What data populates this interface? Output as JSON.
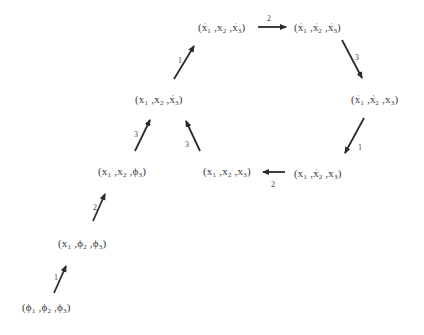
{
  "diagram": {
    "type": "state-transition",
    "colors": {
      "text": "#3a3a3a",
      "arrow": "#2b2b2b",
      "background": "#ffffff"
    },
    "nodes": [
      {
        "id": "n0",
        "label": "(φ1, φ2, φ3)",
        "parts": [
          [
            "φ",
            "1",
            ""
          ],
          [
            "φ",
            "2",
            ""
          ],
          [
            "φ",
            "3",
            ""
          ]
        ],
        "x": 22,
        "y": 300
      },
      {
        "id": "n1",
        "label": "(x1, φ2, φ3)",
        "parts": [
          [
            "x",
            "1",
            ""
          ],
          [
            "φ",
            "2",
            ""
          ],
          [
            "φ",
            "3",
            ""
          ]
        ],
        "x": 58,
        "y": 236
      },
      {
        "id": "n2",
        "label": "(x1, x2, φ3)",
        "parts": [
          [
            "x",
            "1",
            ""
          ],
          [
            "x",
            "2",
            ""
          ],
          [
            "φ",
            "3",
            ""
          ]
        ],
        "x": 98,
        "y": 164
      },
      {
        "id": "n3",
        "label": "(x1, x2, x'3)",
        "parts": [
          [
            "x",
            "1",
            ""
          ],
          [
            "x",
            "2",
            ""
          ],
          [
            "x",
            "3",
            "'"
          ]
        ],
        "x": 135,
        "y": 90
      },
      {
        "id": "n4",
        "label": "(x'1, x2, x'3)",
        "parts": [
          [
            "x",
            "1",
            "'"
          ],
          [
            "x",
            "2",
            ""
          ],
          [
            "x",
            "3",
            "'"
          ]
        ],
        "x": 198,
        "y": 18
      },
      {
        "id": "n5",
        "label": "(x'1, x'2, x'3)",
        "parts": [
          [
            "x",
            "1",
            "'"
          ],
          [
            "x",
            "2",
            "'"
          ],
          [
            "x",
            "3",
            "'"
          ]
        ],
        "x": 294,
        "y": 18
      },
      {
        "id": "n6",
        "label": "(x'1, x'2, x3)",
        "parts": [
          [
            "x",
            "1",
            "'"
          ],
          [
            "x",
            "2",
            "'"
          ],
          [
            "x",
            "3",
            ""
          ]
        ],
        "x": 351,
        "y": 90
      },
      {
        "id": "n7",
        "label": "(x1, x'2, x3)",
        "parts": [
          [
            "x",
            "1",
            ""
          ],
          [
            "x",
            "2",
            "'"
          ],
          [
            "x",
            "3",
            ""
          ]
        ],
        "x": 294,
        "y": 164
      },
      {
        "id": "n8",
        "label": "(x1, x2, x3)",
        "parts": [
          [
            "x",
            "1",
            ""
          ],
          [
            "x",
            "2",
            ""
          ],
          [
            "x",
            "3",
            ""
          ]
        ],
        "x": 203,
        "y": 164
      }
    ],
    "edges": [
      {
        "from": "n0",
        "to": "n1",
        "label": "1",
        "x1": 54,
        "y1": 293,
        "x2": 66,
        "y2": 266,
        "lx": 54,
        "ly": 273
      },
      {
        "from": "n1",
        "to": "n2",
        "label": "2",
        "x1": 93,
        "y1": 221,
        "x2": 105,
        "y2": 194,
        "lx": 93,
        "ly": 203
      },
      {
        "from": "n2",
        "to": "n3",
        "label": "3",
        "x1": 135,
        "y1": 151,
        "x2": 150,
        "y2": 120,
        "lx": 134,
        "ly": 130
      },
      {
        "from": "n8",
        "to": "n3",
        "label": "3",
        "x1": 200,
        "y1": 151,
        "x2": 186,
        "y2": 121,
        "lx": 185,
        "ly": 140
      },
      {
        "from": "n3",
        "to": "n4",
        "label": "1",
        "x1": 174,
        "y1": 79,
        "x2": 194,
        "y2": 46,
        "lx": 178,
        "ly": 56
      },
      {
        "from": "n4",
        "to": "n5",
        "label": "2",
        "x1": 258,
        "y1": 27,
        "x2": 286,
        "y2": 27,
        "lx": 267,
        "ly": 14
      },
      {
        "from": "n5",
        "to": "n6",
        "label": "3",
        "x1": 342,
        "y1": 40,
        "x2": 362,
        "y2": 78,
        "lx": 355,
        "ly": 53
      },
      {
        "from": "n6",
        "to": "n7",
        "label": "1",
        "x1": 364,
        "y1": 118,
        "x2": 345,
        "y2": 153,
        "lx": 358,
        "ly": 143
      },
      {
        "from": "n7",
        "to": "n8",
        "label": "2",
        "x1": 285,
        "y1": 172,
        "x2": 263,
        "y2": 172,
        "lx": 271,
        "ly": 180
      }
    ]
  }
}
